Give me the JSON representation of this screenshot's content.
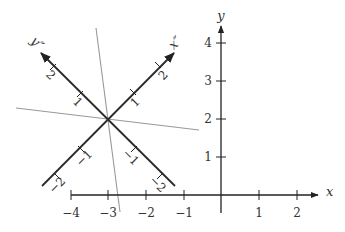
{
  "diagram": {
    "axes": {
      "x_label": "x",
      "y_label": "y",
      "x_ticks": [
        "−4",
        "−3",
        "−2",
        "−1",
        "1",
        "2"
      ],
      "y_ticks": [
        "1",
        "2",
        "3",
        "4"
      ]
    },
    "rotated_axes": {
      "origin": "(-3, 2)",
      "x_label": "x″",
      "y_label": "y″",
      "x_ticks": [
        "−2",
        "−1",
        "1",
        "2"
      ],
      "y_ticks": [
        "−2",
        "−1",
        "1",
        "2"
      ]
    },
    "colors": {
      "axis": "#222222",
      "rotated_axis": "#2a2a2a",
      "gray_line": "#999999",
      "background": "#ffffff"
    }
  }
}
